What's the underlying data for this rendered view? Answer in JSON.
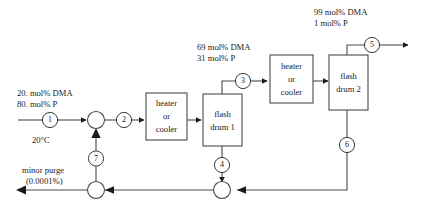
{
  "diagram": {
    "line_color": "#4a4a4a",
    "text_color": "#1a1a1a",
    "background": "#ffffff"
  },
  "units": [
    {
      "id": "heater1",
      "label_line1": "heater",
      "label_line2": "or",
      "label_line3": "cooler"
    },
    {
      "id": "flash1",
      "label_line1": "flash",
      "label_line2": "drum 1"
    },
    {
      "id": "heater2",
      "label_line1": "heater",
      "label_line2": "or",
      "label_line3": "cooler"
    },
    {
      "id": "flash2",
      "label_line1": "flash",
      "label_line2": "drum 2"
    }
  ],
  "streams": [
    {
      "id": "s1",
      "number": "1"
    },
    {
      "id": "s2",
      "number": "2"
    },
    {
      "id": "s3",
      "number": "3"
    },
    {
      "id": "s4",
      "number": "4"
    },
    {
      "id": "s5",
      "number": "5"
    },
    {
      "id": "s6",
      "number": "6"
    },
    {
      "id": "s7",
      "number": "7"
    }
  ],
  "annotations": {
    "feed": {
      "line1": "20. mol% DMA",
      "line2": "80. mol% P",
      "temperature": "20°C"
    },
    "stream3": {
      "line1": "69 mol% DMA",
      "line2": "31 mol% P"
    },
    "stream5": {
      "line1": "99 mol% DMA",
      "line2": "1 mol% P"
    },
    "purge": {
      "line1": "minor purge",
      "line2": "(0.0001%)"
    }
  },
  "junctions": [
    {
      "id": "mixer-feed-recycle"
    },
    {
      "id": "splitter-purge"
    },
    {
      "id": "mixer-bottoms"
    }
  ]
}
